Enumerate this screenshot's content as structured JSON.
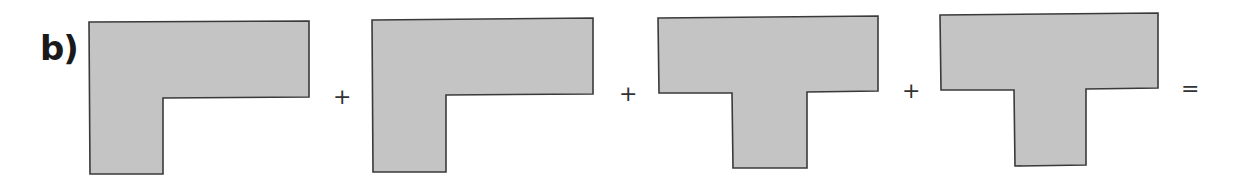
{
  "exercise": {
    "label": "b)",
    "shapes": [
      {
        "name": "l-shape-1",
        "type": "L",
        "points": "89,22 309,21 309,97 163,98 163,174 90,174"
      },
      {
        "name": "l-shape-2",
        "type": "L",
        "points": "372,20 593,18 593,94 446,95 446,172 373,172"
      },
      {
        "name": "t-shape-1",
        "type": "T",
        "points": "658,18 878,16 878,91 807,92 807,168 733,168 732,93 659,93"
      },
      {
        "name": "t-shape-2",
        "type": "T",
        "points": "940,15 1158,13 1158,88 1086,89 1086,165 1015,166 1014,90 941,90"
      }
    ],
    "operators": [
      {
        "symbol": "+",
        "x": 333,
        "y": 86
      },
      {
        "symbol": "+",
        "x": 619,
        "y": 83
      },
      {
        "symbol": "+",
        "x": 902,
        "y": 80
      },
      {
        "symbol": "=",
        "x": 1181,
        "y": 78
      }
    ],
    "colors": {
      "fill": "#c4c4c4",
      "stroke": "#3a3a3a"
    }
  }
}
